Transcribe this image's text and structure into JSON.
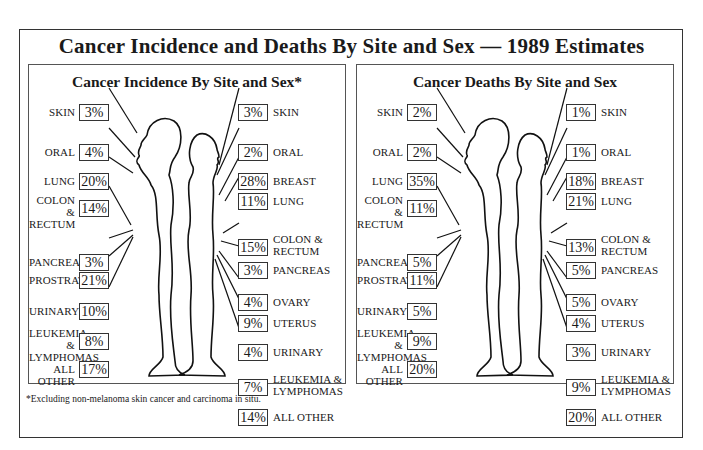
{
  "title": "Cancer Incidence and Deaths By Site and Sex — 1989 Estimates",
  "footnote": "*Excluding non-melanoma skin cancer and carcinoma in situ.",
  "panels": {
    "incidence": {
      "title": "Cancer Incidence By Site and Sex*",
      "male": [
        {
          "site": "SKIN",
          "pct": "3%"
        },
        {
          "site": "ORAL",
          "pct": "4%"
        },
        {
          "site": "LUNG",
          "pct": "20%"
        },
        {
          "site": "COLON &",
          "site2": "RECTUM",
          "pct": "14%"
        },
        {
          "site": "PANCREAS",
          "pct": "3%"
        },
        {
          "site": "PROSTRATE",
          "pct": "21%"
        },
        {
          "site": "URINARY",
          "pct": "10%"
        },
        {
          "site": "LEUKEMIA &",
          "site2": "LYMPHOMAS",
          "pct": "8%"
        },
        {
          "site": "ALL OTHER",
          "pct": "17%"
        }
      ],
      "female": [
        {
          "site": "SKIN",
          "pct": "3%"
        },
        {
          "site": "ORAL",
          "pct": "2%"
        },
        {
          "site": "BREAST",
          "pct": "28%"
        },
        {
          "site": "LUNG",
          "pct": "11%"
        },
        {
          "site": "COLON &",
          "site2": "RECTUM",
          "pct": "15%"
        },
        {
          "site": "PANCREAS",
          "pct": "3%"
        },
        {
          "site": "OVARY",
          "pct": "4%"
        },
        {
          "site": "UTERUS",
          "pct": "9%"
        },
        {
          "site": "URINARY",
          "pct": "4%"
        },
        {
          "site": "LEUKEMIA &",
          "site2": "LYMPHOMAS",
          "pct": "7%"
        },
        {
          "site": "ALL OTHER",
          "pct": "14%"
        }
      ]
    },
    "deaths": {
      "title": "Cancer Deaths By Site and Sex",
      "male": [
        {
          "site": "SKIN",
          "pct": "2%"
        },
        {
          "site": "ORAL",
          "pct": "2%"
        },
        {
          "site": "LUNG",
          "pct": "35%"
        },
        {
          "site": "COLON &",
          "site2": "RECTUM",
          "pct": "11%"
        },
        {
          "site": "PANCREAS",
          "pct": "5%"
        },
        {
          "site": "PROSTRATE",
          "pct": "11%"
        },
        {
          "site": "URINARY",
          "pct": "5%"
        },
        {
          "site": "LEUKEMIA &",
          "site2": "LYMPHOMAS",
          "pct": "9%"
        },
        {
          "site": "ALL OTHER",
          "pct": "20%"
        }
      ],
      "female": [
        {
          "site": "SKIN",
          "pct": "1%"
        },
        {
          "site": "ORAL",
          "pct": "1%"
        },
        {
          "site": "BREAST",
          "pct": "18%"
        },
        {
          "site": "LUNG",
          "pct": "21%"
        },
        {
          "site": "COLON &",
          "site2": "RECTUM",
          "pct": "13%"
        },
        {
          "site": "PANCREAS",
          "pct": "5%"
        },
        {
          "site": "OVARY",
          "pct": "5%"
        },
        {
          "site": "UTERUS",
          "pct": "4%"
        },
        {
          "site": "URINARY",
          "pct": "3%"
        },
        {
          "site": "LEUKEMIA &",
          "site2": "LYMPHOMAS",
          "pct": "9%"
        },
        {
          "site": "ALL OTHER",
          "pct": "20%"
        }
      ]
    }
  }
}
